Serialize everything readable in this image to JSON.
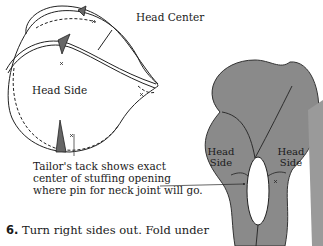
{
  "figure1": {
    "label_head_center": "Head Center",
    "label_head_side": "Head Side",
    "caption": "Tailor's tack shows exact center of stuffing opening where pin for neck joint will go."
  },
  "figure2": {
    "left_label": "Head Side",
    "right_label": "Head Side",
    "fill_color": "#8a8a8a"
  },
  "step": {
    "number": "6.",
    "text": "Turn right sides out. Fold under",
    "text_cut": "the seam allowances and baste closed"
  }
}
